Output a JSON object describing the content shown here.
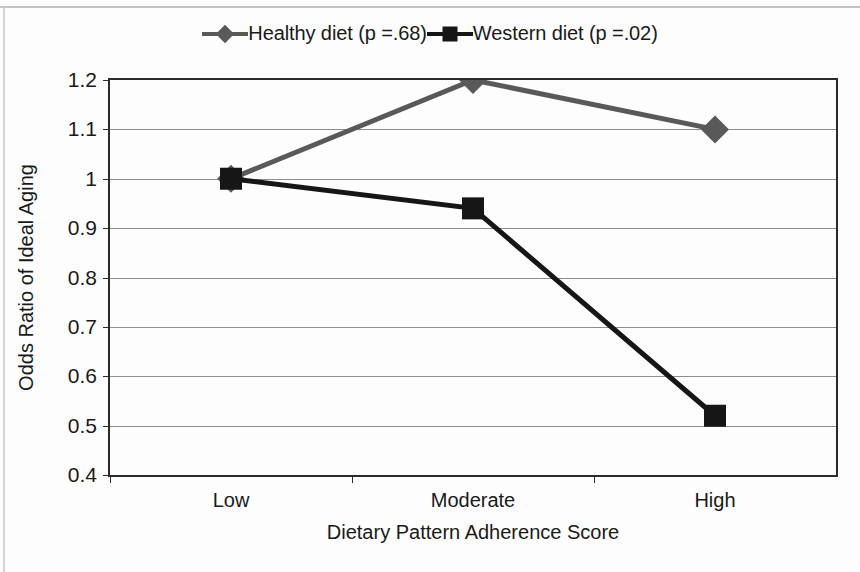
{
  "chart_data": {
    "type": "line",
    "title": "",
    "xlabel": "Dietary Pattern Adherence Score",
    "ylabel": "Odds Ratio of Ideal Aging",
    "categories": [
      "Low",
      "Moderate",
      "High"
    ],
    "ylim": [
      0.4,
      1.2
    ],
    "yticks": [
      0.4,
      0.5,
      0.6,
      0.7,
      0.8,
      0.9,
      1.0,
      1.1,
      1.2
    ],
    "ytick_labels": [
      "0.4",
      "0.5",
      "0.6",
      "0.7",
      "0.8",
      "0.9",
      "1",
      "1.1",
      "1.2"
    ],
    "grid": true,
    "legend_position": "top-center",
    "series": [
      {
        "name": "Healthy diet (p =.68)",
        "marker": "diamond",
        "color": "#595959",
        "values": [
          1.0,
          1.2,
          1.1
        ]
      },
      {
        "name": "Western diet (p =.02)",
        "marker": "square",
        "color": "#161616",
        "values": [
          1.0,
          0.94,
          0.52
        ]
      }
    ]
  },
  "legend": {
    "entries": [
      {
        "label": "Healthy diet (p =.68)"
      },
      {
        "label": "Western diet (p =.02)"
      }
    ]
  },
  "axes": {
    "y_title": "Odds Ratio of Ideal Aging",
    "x_title": "Dietary Pattern Adherence Score",
    "y_tick_labels": [
      "1.2",
      "1.1",
      "1",
      "0.9",
      "0.8",
      "0.7",
      "0.6",
      "0.5",
      "0.4"
    ],
    "x_tick_labels": [
      "Low",
      "Moderate",
      "High"
    ]
  }
}
